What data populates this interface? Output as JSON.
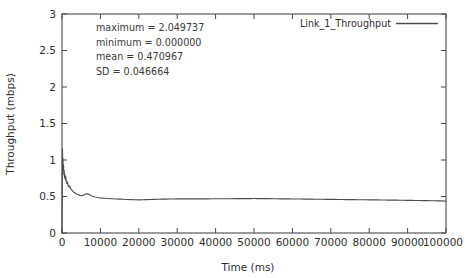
{
  "chart_data": {
    "type": "line",
    "title": "",
    "xlabel": "Time (ms)",
    "ylabel": "Throughput (mbps)",
    "xlim": [
      0,
      100000
    ],
    "ylim": [
      0,
      3
    ],
    "grid": false,
    "legend_position": "top-right",
    "xticks": [
      0,
      10000,
      20000,
      30000,
      40000,
      50000,
      60000,
      70000,
      80000,
      90000,
      100000
    ],
    "xtick_labels": [
      "0",
      "10000",
      "20000",
      "30000",
      "40000",
      "50000",
      "60000",
      "70000",
      "80000",
      "90000",
      "100000"
    ],
    "yticks": [
      0,
      0.5,
      1,
      1.5,
      2,
      2.5,
      3
    ],
    "ytick_labels": [
      "0",
      "0.5",
      "1",
      "1.5",
      "2",
      "2.5",
      "3"
    ],
    "series": [
      {
        "name": "Link_1_Throughput",
        "color": "#4d4d4d",
        "x": [
          0,
          120,
          200,
          260,
          320,
          400,
          480,
          560,
          650,
          750,
          860,
          980,
          1100,
          1250,
          1400,
          1600,
          1800,
          2000,
          2250,
          2500,
          2800,
          3100,
          3500,
          3900,
          4300,
          4700,
          5100,
          5500,
          5900,
          6200,
          6500,
          6800,
          7100,
          7500,
          8000,
          8600,
          9200,
          10000,
          11000,
          12000,
          13000,
          14000,
          15000,
          16000,
          17000,
          18000,
          19000,
          20000,
          21000,
          22000,
          23000,
          24000,
          25000,
          26000,
          27000,
          28000,
          29000,
          30000,
          31000,
          32000,
          33000,
          34000,
          35000,
          36000,
          37000,
          38000,
          39000,
          40000,
          41000,
          42000,
          43000,
          44000,
          45000,
          46000,
          47000,
          48000,
          49000,
          50000,
          51000,
          52000,
          53000,
          54000,
          55000,
          56000,
          57000,
          58000,
          59000,
          60000,
          61000,
          62000,
          63000,
          64000,
          65000,
          66000,
          67000,
          68000,
          69000,
          70000,
          71000,
          72000,
          73000,
          74000,
          75000,
          76000,
          77000,
          78000,
          79000,
          80000,
          81000,
          82000,
          83000,
          84000,
          85000,
          86000,
          87000,
          88000,
          89000,
          90000,
          91000,
          92000,
          93000,
          94000,
          95000,
          96000,
          97000,
          98000,
          99000,
          100000
        ],
        "y": [
          0,
          1.15,
          0.92,
          1.02,
          0.86,
          0.93,
          0.8,
          0.86,
          0.76,
          0.8,
          0.73,
          0.77,
          0.71,
          0.68,
          0.7,
          0.65,
          0.63,
          0.645,
          0.605,
          0.59,
          0.575,
          0.558,
          0.545,
          0.532,
          0.523,
          0.515,
          0.512,
          0.518,
          0.528,
          0.534,
          0.536,
          0.533,
          0.526,
          0.515,
          0.503,
          0.493,
          0.487,
          0.481,
          0.476,
          0.472,
          0.469,
          0.466,
          0.464,
          0.463,
          0.4585,
          0.4565,
          0.4555,
          0.4545,
          0.456,
          0.4575,
          0.459,
          0.4605,
          0.462,
          0.4635,
          0.4645,
          0.4655,
          0.4665,
          0.4668,
          0.467,
          0.4672,
          0.4674,
          0.4676,
          0.4678,
          0.468,
          0.4682,
          0.4684,
          0.4686,
          0.4688,
          0.469,
          0.4693,
          0.4696,
          0.4699,
          0.4702,
          0.4706,
          0.471,
          0.4714,
          0.4718,
          0.4722,
          0.4718,
          0.4712,
          0.4706,
          0.47,
          0.4694,
          0.4688,
          0.4682,
          0.4676,
          0.467,
          0.4664,
          0.4658,
          0.4652,
          0.4646,
          0.464,
          0.4634,
          0.4628,
          0.4622,
          0.4616,
          0.461,
          0.4604,
          0.4598,
          0.4592,
          0.4586,
          0.458,
          0.4574,
          0.4568,
          0.4562,
          0.4556,
          0.455,
          0.4544,
          0.4538,
          0.4532,
          0.4526,
          0.452,
          0.4512,
          0.4504,
          0.4496,
          0.4488,
          0.448,
          0.4472,
          0.4464,
          0.4456,
          0.4448,
          0.444,
          0.4432,
          0.4424,
          0.4416,
          0.4408,
          0.44,
          0.4355
        ]
      }
    ],
    "annotations": [
      {
        "text": "maximum = 2.049737"
      },
      {
        "text": "minimum = 0.000000"
      },
      {
        "text": "mean = 0.470967"
      },
      {
        "text": "SD = 0.046664"
      }
    ],
    "statistics": {
      "maximum": 2.049737,
      "minimum": 0.0,
      "mean": 0.470967,
      "sd": 0.046664
    }
  }
}
